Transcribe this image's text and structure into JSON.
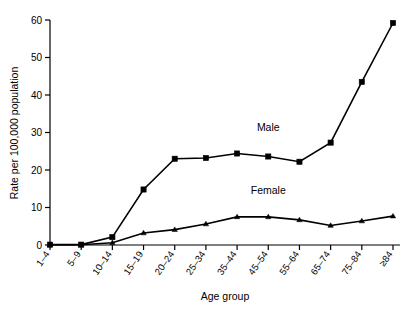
{
  "chart_data": {
    "type": "line",
    "title": "",
    "xlabel": "Age group",
    "ylabel": "Rate per 100,000 population",
    "categories": [
      "1–4",
      "5–9",
      "10–14",
      "15–19",
      "20–24",
      "25–34",
      "35–44",
      "45–54",
      "55–64",
      "65–74",
      "75–84",
      "≥84"
    ],
    "ylim": [
      0,
      60
    ],
    "yticks": [
      0,
      10,
      20,
      30,
      40,
      50,
      60
    ],
    "ytick_labels": [
      "0",
      "10",
      "20",
      "30",
      "40",
      "50",
      "60"
    ],
    "grid": false,
    "legend_position": "inline-annotation",
    "series": [
      {
        "name": "Male",
        "marker": "square",
        "color": "#000000",
        "values": [
          0.1,
          0.1,
          2.1,
          14.8,
          23.0,
          23.2,
          24.4,
          23.6,
          22.2,
          27.3,
          43.5,
          59.2
        ]
      },
      {
        "name": "Female",
        "marker": "triangle",
        "color": "#000000",
        "values": [
          0.05,
          0.05,
          0.6,
          3.2,
          4.1,
          5.6,
          7.5,
          7.5,
          6.7,
          5.2,
          6.4,
          7.7
        ]
      }
    ],
    "annotations": [
      {
        "text": "Male",
        "x_category": "45–54",
        "y_value": 30.5
      },
      {
        "text": "Female",
        "x_category": "45–54",
        "y_value": 13.5
      }
    ]
  },
  "axes": {
    "y_axis_label": "Rate per 100,000 population",
    "x_axis_label": "Age group"
  }
}
